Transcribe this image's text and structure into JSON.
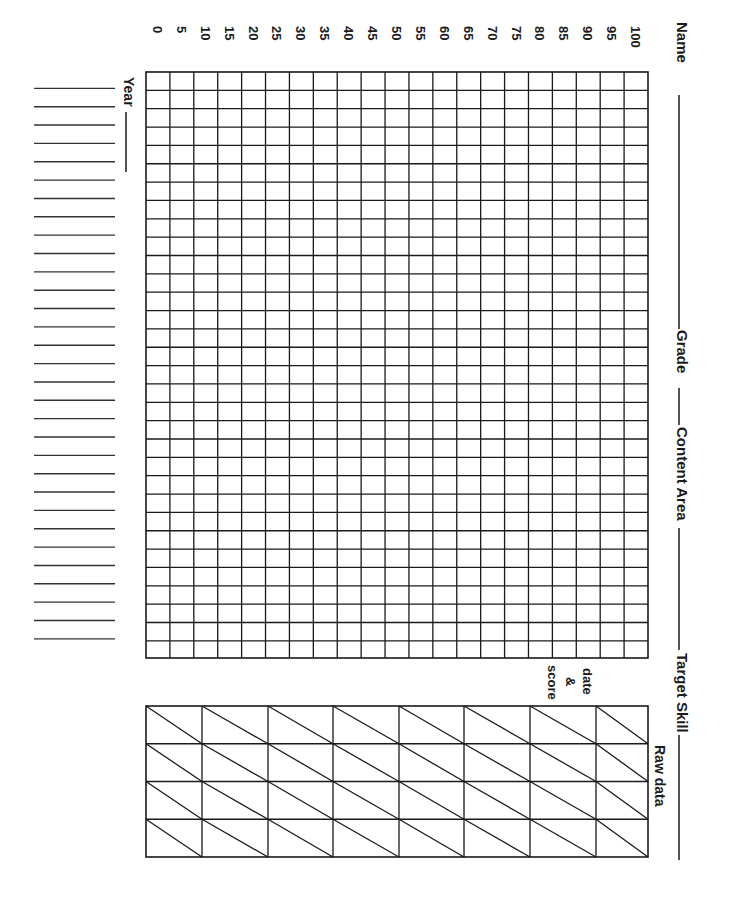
{
  "header": {
    "name_label": "Name",
    "grade_label": "Grade",
    "content_area_label": "Content Area",
    "target_skill_label": "Target Skill"
  },
  "chart": {
    "score_ticks": [
      "0",
      "5",
      "10",
      "15",
      "20",
      "25",
      "30",
      "35",
      "40",
      "45",
      "50",
      "55",
      "60",
      "65",
      "70",
      "75",
      "80",
      "85",
      "90",
      "95",
      "100"
    ],
    "year_label": "Year",
    "session_rows": 32
  },
  "raw_data": {
    "title": "Raw data",
    "cell_caption_line1": "date",
    "cell_caption_line2": "&",
    "cell_caption_line3": "score",
    "columns": 8,
    "rows": 4
  },
  "colors": {
    "ink": "#1a1a1a",
    "paper": "#ffffff"
  }
}
